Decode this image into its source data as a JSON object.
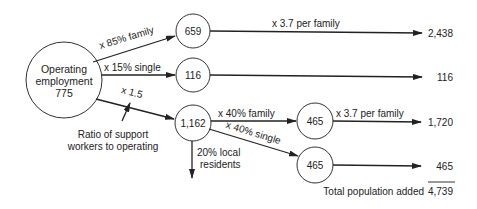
{
  "nodes": {
    "operating": {
      "line1": "Operating",
      "line2": "employment",
      "value": "775"
    },
    "family": "659",
    "single": "116",
    "support": "1,162",
    "support_family": "465",
    "support_single": "465"
  },
  "edges": {
    "to_family": "x 85% family",
    "to_single": "x 15% single",
    "to_support": "x 1.5",
    "family_out": "x 3.7 per family",
    "support_to_family": "x 40% family",
    "support_to_single": "x 40% single",
    "support_family_out": "x 3.7 per family",
    "local_residents": [
      "20% local",
      "residents"
    ]
  },
  "annotation": [
    "Ratio of support",
    "workers to operating"
  ],
  "results": {
    "family_pop": "2,438",
    "single_pop": "116",
    "support_family_pop": "1,720",
    "support_single_pop": "465",
    "total_label": "Total population added",
    "total_value": "4,739"
  }
}
